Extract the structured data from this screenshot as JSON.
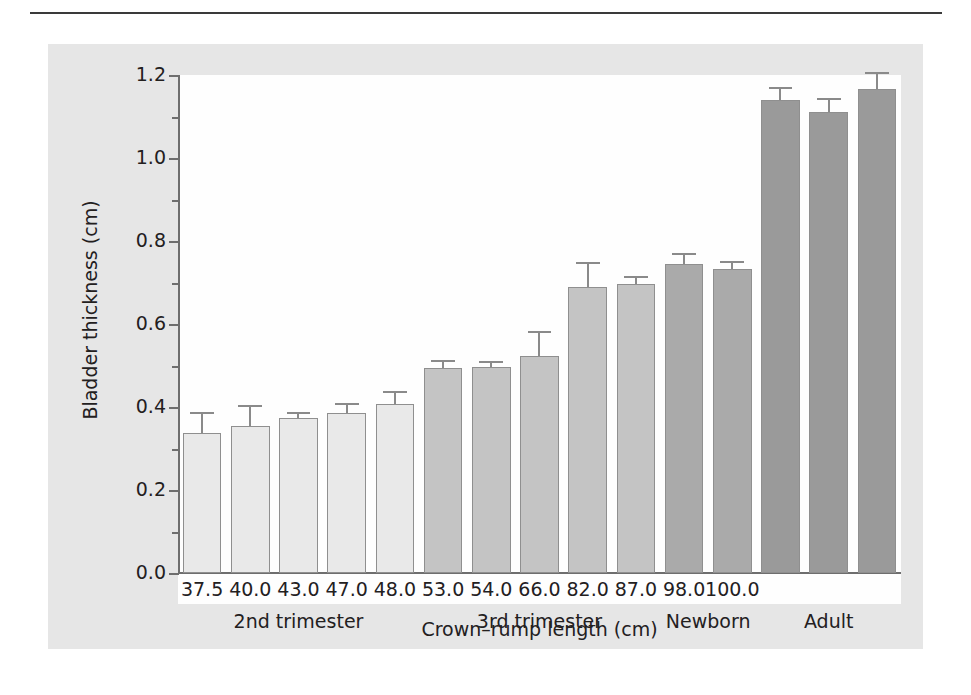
{
  "chart_data": {
    "type": "bar",
    "title": "",
    "xlabel": "Crown–rump length (cm)",
    "ylabel": "Bladder thickness (cm)",
    "ylim": [
      0.0,
      1.2
    ],
    "yticks": [
      "0.0",
      "0.2",
      "0.4",
      "0.6",
      "0.8",
      "1.0",
      "1.2"
    ],
    "ytick_values": [
      0.0,
      0.2,
      0.4,
      0.6,
      0.8,
      1.0,
      1.2
    ],
    "yminor_step": 0.1,
    "grid": false,
    "legend": "none",
    "categories": [
      "37.5",
      "40.0",
      "43.0",
      "47.0",
      "48.0",
      "53.0",
      "54.0",
      "66.0",
      "82.0",
      "87.0",
      "98.0",
      "100.0",
      "",
      "",
      ""
    ],
    "values": [
      0.337,
      0.354,
      0.374,
      0.386,
      0.407,
      0.494,
      0.497,
      0.524,
      0.69,
      0.697,
      0.744,
      0.733,
      1.14,
      1.11,
      1.167
    ],
    "errors_upper": [
      0.388,
      0.405,
      0.387,
      0.41,
      0.438,
      0.513,
      0.512,
      0.584,
      0.75,
      0.716,
      0.772,
      0.752,
      1.172,
      1.145,
      1.208
    ],
    "groups": [
      {
        "label": "2nd trimester",
        "start_index": 0,
        "count": 5,
        "color": "#e9e9e9"
      },
      {
        "label": "3rd trimester",
        "start_index": 5,
        "count": 5,
        "color": "#c4c4c4"
      },
      {
        "label": "Newborn",
        "start_index": 10,
        "count": 2,
        "color": "#aaaaaa"
      },
      {
        "label": "Adult",
        "start_index": 12,
        "count": 3,
        "color": "#9a9a9a"
      }
    ],
    "bar_edge_color": "#8f8f8f",
    "error_bar_color": "#8a8a8a",
    "axis_color": "#6e6e6e",
    "text_color": "#23201e",
    "plot_background": "#fefefe",
    "figure_background": "#e6e6e6"
  }
}
